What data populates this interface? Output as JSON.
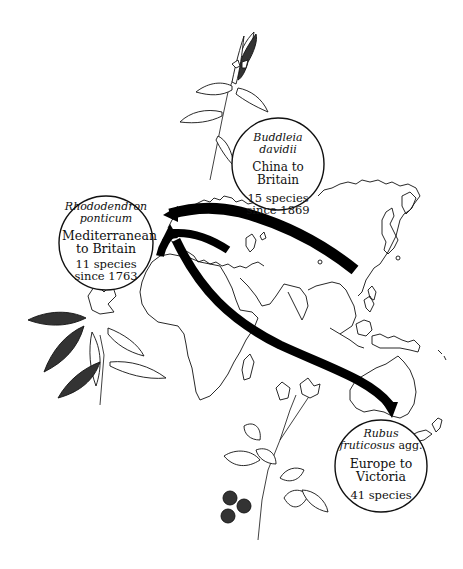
{
  "diagram": {
    "type": "plant-introduction-map",
    "colors": {
      "ink": "#111111",
      "background": "#ffffff",
      "arrow": "#000000"
    },
    "introductions": [
      {
        "species_line1": "Buddleia",
        "species_line2": "davidii",
        "route": "China to Britain",
        "count_line1": "15 species",
        "count_line2": "since 1869"
      },
      {
        "species_line1": "Rhododendron",
        "species_line2": "ponticum",
        "route_line1": "Mediterranean",
        "route_line2": "to Britain",
        "count_line1": "11 species",
        "count_line2": "since 1763"
      },
      {
        "species_line1": "Rubus",
        "species_line2": "fruticosus",
        "species_suffix": " agg.",
        "route_line1": "Europe to",
        "route_line2": "Victoria",
        "count_line1": "41 species"
      }
    ],
    "arrows": [
      {
        "from": "China",
        "to": "Britain"
      },
      {
        "from": "Mediterranean",
        "to": "Britain"
      },
      {
        "from": "Europe",
        "to": "Victoria"
      }
    ],
    "icons": [
      "buddleia-illustration",
      "rhododendron-illustration",
      "rubus-illustration",
      "butterfly-illustration"
    ]
  }
}
